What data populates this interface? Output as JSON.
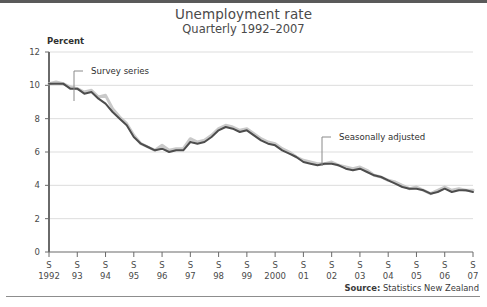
{
  "chart_data": {
    "type": "line",
    "title": "Unemployment rate",
    "subtitle": "Quarterly 1992–2007",
    "ylabel": "Percent",
    "xlabel": "",
    "ylim": [
      0,
      12
    ],
    "yticks": [
      0,
      2,
      4,
      6,
      8,
      10,
      12
    ],
    "grid": true,
    "legend_position": "none",
    "x_tick_quarter_label": "S",
    "x_tick_years": [
      "1992",
      "93",
      "94",
      "95",
      "96",
      "97",
      "98",
      "99",
      "2000",
      "01",
      "02",
      "03",
      "04",
      "05",
      "06",
      "07"
    ],
    "x": [
      "1992Q1",
      "1992Q2",
      "1992Q3",
      "1992Q4",
      "1993Q1",
      "1993Q2",
      "1993Q3",
      "1993Q4",
      "1994Q1",
      "1994Q2",
      "1994Q3",
      "1994Q4",
      "1995Q1",
      "1995Q2",
      "1995Q3",
      "1995Q4",
      "1996Q1",
      "1996Q2",
      "1996Q3",
      "1996Q4",
      "1997Q1",
      "1997Q2",
      "1997Q3",
      "1997Q4",
      "1998Q1",
      "1998Q2",
      "1998Q3",
      "1998Q4",
      "1999Q1",
      "1999Q2",
      "1999Q3",
      "1999Q4",
      "2000Q1",
      "2000Q2",
      "2000Q3",
      "2000Q4",
      "2001Q1",
      "2001Q2",
      "2001Q3",
      "2001Q4",
      "2002Q1",
      "2002Q2",
      "2002Q3",
      "2002Q4",
      "2003Q1",
      "2003Q2",
      "2003Q3",
      "2003Q4",
      "2004Q1",
      "2004Q2",
      "2004Q3",
      "2004Q4",
      "2005Q1",
      "2005Q2",
      "2005Q3",
      "2005Q4",
      "2006Q1",
      "2006Q2",
      "2006Q3",
      "2006Q4",
      "2007Q1"
    ],
    "series": [
      {
        "name": "Survey series",
        "color": "#c9c9c9",
        "values": [
          10.1,
          10.2,
          10.1,
          9.9,
          9.8,
          9.6,
          9.7,
          9.3,
          9.4,
          8.6,
          8.1,
          7.7,
          7.0,
          6.5,
          6.3,
          6.1,
          6.4,
          6.1,
          6.2,
          6.2,
          6.8,
          6.6,
          6.7,
          7.0,
          7.4,
          7.6,
          7.5,
          7.3,
          7.4,
          7.1,
          6.8,
          6.6,
          6.5,
          6.2,
          6.0,
          5.7,
          5.5,
          5.4,
          5.3,
          5.3,
          5.4,
          5.2,
          5.1,
          5.0,
          5.1,
          4.9,
          4.6,
          4.5,
          4.3,
          4.2,
          4.0,
          3.8,
          3.9,
          3.7,
          3.5,
          3.7,
          3.9,
          3.7,
          3.8,
          3.7,
          3.7
        ]
      },
      {
        "name": "Seasonally adjusted",
        "color": "#4d4d4d",
        "values": [
          10.1,
          10.1,
          10.1,
          9.8,
          9.8,
          9.5,
          9.6,
          9.2,
          8.9,
          8.4,
          8.0,
          7.6,
          6.9,
          6.5,
          6.3,
          6.1,
          6.2,
          6.0,
          6.1,
          6.1,
          6.6,
          6.5,
          6.6,
          6.9,
          7.3,
          7.5,
          7.4,
          7.2,
          7.3,
          7.0,
          6.7,
          6.5,
          6.4,
          6.1,
          5.9,
          5.7,
          5.4,
          5.3,
          5.2,
          5.3,
          5.3,
          5.2,
          5.0,
          4.9,
          5.0,
          4.8,
          4.6,
          4.5,
          4.3,
          4.1,
          3.9,
          3.8,
          3.8,
          3.7,
          3.5,
          3.6,
          3.8,
          3.6,
          3.7,
          3.7,
          3.6
        ]
      }
    ],
    "annotations": [
      {
        "label": "Survey series",
        "target_x": "1994Q1",
        "target_y": 9.4,
        "text_x_px": 91,
        "text_y_px": 74,
        "leader_x_px": 74,
        "leader_top_px": 71,
        "leader_bottom_px": 101
      },
      {
        "label": "Seasonally adjusted",
        "target_x": "2002Q2",
        "target_y": 5.2,
        "text_x_px": 339,
        "text_y_px": 140,
        "leader_x_px": 322,
        "leader_top_px": 137,
        "leader_bottom_px": 166
      }
    ],
    "source_label": "Source:",
    "source_value": "Statistics New Zealand"
  }
}
